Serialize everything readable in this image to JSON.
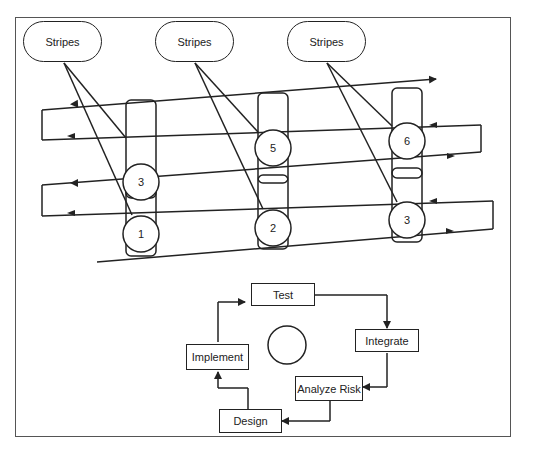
{
  "stripes": [
    {
      "label": "Stripes"
    },
    {
      "label": "Stripes"
    },
    {
      "label": "Stripes"
    }
  ],
  "nodes": {
    "top_row": [
      "3",
      "5",
      "6"
    ],
    "bottom_row": [
      "1",
      "2",
      "3"
    ]
  },
  "cycle": {
    "steps": [
      "Test",
      "Integrate",
      "Analyze Risk",
      "Design",
      "Implement"
    ]
  },
  "colors": {
    "stroke": "#222222",
    "frame": "#555555",
    "background": "#ffffff"
  }
}
